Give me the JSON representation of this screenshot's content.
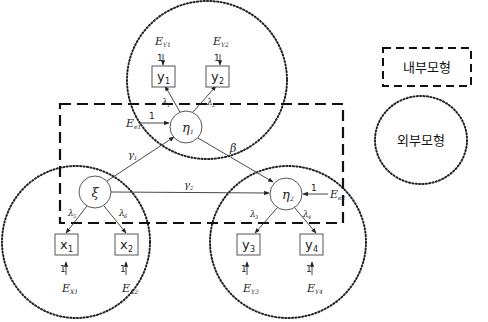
{
  "legend": {
    "inner_model": "내부모형",
    "outer_model": "외부모형"
  },
  "latent": {
    "eta1": {
      "main": "η",
      "sub": "1"
    },
    "eta2": {
      "main": "η",
      "sub": "2"
    },
    "xi": {
      "main": "ξ"
    }
  },
  "observed": {
    "y1": {
      "main": "y",
      "sub": "1"
    },
    "y2": {
      "main": "y",
      "sub": "2"
    },
    "y3": {
      "main": "y",
      "sub": "3"
    },
    "y4": {
      "main": "y",
      "sub": "4"
    },
    "x1": {
      "main": "x",
      "sub": "1"
    },
    "x2": {
      "main": "x",
      "sub": "2"
    }
  },
  "errors": {
    "ey1": {
      "main": "E",
      "sub": "Y1"
    },
    "ey2": {
      "main": "E",
      "sub": "Y2"
    },
    "ey3": {
      "main": "E",
      "sub": "Y3"
    },
    "ey4": {
      "main": "E",
      "sub": "Y4"
    },
    "ex1": {
      "main": "E",
      "sub": "X1"
    },
    "ex2": {
      "main": "E",
      "sub": "X2"
    },
    "ee1": {
      "main": "E",
      "sub": "e1"
    },
    "ee2": {
      "main": "E",
      "sub": "e2"
    }
  },
  "paths": {
    "gamma1": {
      "main": "γ",
      "sub": "1"
    },
    "gamma2": {
      "main": "γ",
      "sub": "2"
    },
    "beta": {
      "main": "β"
    },
    "lambda1": {
      "main": "λ",
      "sub": "1"
    },
    "lambda2": {
      "main": "λ",
      "sub": "2"
    },
    "lambda3": {
      "main": "λ",
      "sub": "3"
    },
    "lambda4": {
      "main": "λ",
      "sub": "4"
    },
    "lambda5": {
      "main": "λ",
      "sub": "5"
    },
    "lambda6": {
      "main": "λ",
      "sub": "6"
    }
  },
  "fixed_loading": "1"
}
